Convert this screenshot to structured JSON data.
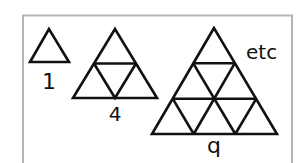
{
  "figure": {
    "colors": {
      "frame": "#b5b5b5",
      "stroke": "#111111",
      "background": "#ffffff"
    },
    "triangles": [
      {
        "label": "1",
        "divisions": 1
      },
      {
        "label": "4",
        "divisions": 2
      },
      {
        "label": "q",
        "divisions": 3
      }
    ],
    "annotation": "etc"
  }
}
